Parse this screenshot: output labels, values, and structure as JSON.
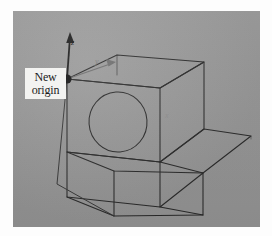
{
  "figure": {
    "background_color": "#9b9b9b",
    "page_color": "#fdfdfd",
    "line_color": "#2b2b2b"
  },
  "callout": {
    "line1": "New",
    "line2": "origin",
    "box_color": "#f3f3f1",
    "text_color": "#1b1b1b",
    "pointer": "arrow-to-origin"
  },
  "axes": {
    "z_label": "z",
    "y_label": "y",
    "x_label": "x",
    "origin_marker": "filled-dot"
  },
  "geometry": {
    "shape": "L-shaped block",
    "hole": {
      "feature": "through-hole",
      "face": "front-vertical-face",
      "shape": "circle"
    }
  }
}
